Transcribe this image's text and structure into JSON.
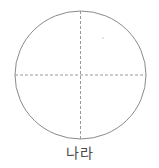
{
  "figure": {
    "caption": "나라",
    "background_color": "#ffffff",
    "width": 159,
    "height": 168,
    "shape": {
      "icon": "ellipse-outline-icon",
      "type": "ellipse",
      "center_x": 80.5,
      "center_y": 75,
      "radius_x": 65.5,
      "radius_y": 64,
      "stroke_color": "#8a8a8a",
      "stroke_width": 1,
      "fill": "none"
    },
    "axes": [
      {
        "icon": "horizontal-dashed-diameter-icon",
        "name": "horizontal-diameter",
        "orientation": "horizontal",
        "x1": 15,
        "y1": 75,
        "x2": 146,
        "y2": 75,
        "stroke_color": "#9a9a9a",
        "stroke_width": 1,
        "dash": "3 2"
      },
      {
        "icon": "vertical-dashed-diameter-icon",
        "name": "vertical-diameter",
        "orientation": "vertical",
        "x1": 80.5,
        "y1": 11,
        "x2": 80.5,
        "y2": 139,
        "stroke_color": "#9a9a9a",
        "stroke_width": 1,
        "dash": "3 2"
      }
    ],
    "artifact": {
      "icon": "speck-artifact-icon",
      "x": 103,
      "y": 38,
      "radius": 1,
      "color": "#dcdcdc"
    },
    "caption_color": "#4a4a4a"
  }
}
